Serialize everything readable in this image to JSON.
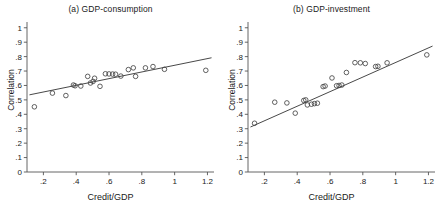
{
  "figure": {
    "background": "#ffffff",
    "axis_color": "#555555",
    "marker_color": "#444444",
    "line_color": "#333333"
  },
  "chart_data": [
    {
      "type": "scatter",
      "title": "(a) GDP-consumption",
      "xlabel": "Credit/GDP",
      "ylabel": "Correlation",
      "xlim": [
        0.1,
        1.24
      ],
      "ylim": [
        0,
        1.04
      ],
      "xticks": [
        0.2,
        0.4,
        0.6,
        0.8,
        1.0,
        1.2
      ],
      "xticklabels": [
        ".2",
        ".4",
        ".6",
        ".8",
        "1",
        "1.2"
      ],
      "yticks": [
        0,
        0.1,
        0.2,
        0.3,
        0.4,
        0.5,
        0.6,
        0.7,
        0.8,
        0.9,
        1.0
      ],
      "yticklabels": [
        "0",
        ".1",
        ".2",
        ".3",
        ".4",
        ".5",
        ".6",
        ".7",
        ".8",
        ".9",
        "1"
      ],
      "grid": false,
      "legend": "none",
      "marker": "open-circle",
      "points": [
        {
          "x": 0.145,
          "y": 0.452
        },
        {
          "x": 0.255,
          "y": 0.547
        },
        {
          "x": 0.337,
          "y": 0.53
        },
        {
          "x": 0.383,
          "y": 0.603
        },
        {
          "x": 0.393,
          "y": 0.598
        },
        {
          "x": 0.428,
          "y": 0.596
        },
        {
          "x": 0.47,
          "y": 0.663
        },
        {
          "x": 0.487,
          "y": 0.617
        },
        {
          "x": 0.503,
          "y": 0.628
        },
        {
          "x": 0.512,
          "y": 0.65
        },
        {
          "x": 0.545,
          "y": 0.594
        },
        {
          "x": 0.578,
          "y": 0.681
        },
        {
          "x": 0.6,
          "y": 0.68
        },
        {
          "x": 0.622,
          "y": 0.679
        },
        {
          "x": 0.64,
          "y": 0.678
        },
        {
          "x": 0.672,
          "y": 0.665
        },
        {
          "x": 0.718,
          "y": 0.71
        },
        {
          "x": 0.748,
          "y": 0.722
        },
        {
          "x": 0.762,
          "y": 0.663
        },
        {
          "x": 0.822,
          "y": 0.722
        },
        {
          "x": 0.868,
          "y": 0.731
        },
        {
          "x": 0.938,
          "y": 0.712
        },
        {
          "x": 1.19,
          "y": 0.705
        }
      ],
      "fit_line": {
        "x": [
          0.115,
          1.225
        ],
        "y": [
          0.535,
          0.792
        ]
      }
    },
    {
      "type": "scatter",
      "title": "(b) GDP-investment",
      "xlabel": "Credit/GDP",
      "ylabel": "Correlation",
      "xlim": [
        0.1,
        1.24
      ],
      "ylim": [
        0,
        1.04
      ],
      "xticks": [
        0.2,
        0.4,
        0.6,
        0.8,
        1.0,
        1.2
      ],
      "xticklabels": [
        ".2",
        ".4",
        ".6",
        ".8",
        "1",
        "1.2"
      ],
      "yticks": [
        0,
        0.1,
        0.2,
        0.3,
        0.4,
        0.5,
        0.6,
        0.7,
        0.8,
        0.9,
        1.0
      ],
      "yticklabels": [
        "0",
        ".1",
        ".2",
        ".3",
        ".4",
        ".5",
        ".6",
        ".7",
        ".8",
        ".9",
        "1"
      ],
      "grid": false,
      "legend": "none",
      "marker": "open-circle",
      "points": [
        {
          "x": 0.14,
          "y": 0.338
        },
        {
          "x": 0.263,
          "y": 0.484
        },
        {
          "x": 0.337,
          "y": 0.479
        },
        {
          "x": 0.388,
          "y": 0.408
        },
        {
          "x": 0.44,
          "y": 0.496
        },
        {
          "x": 0.452,
          "y": 0.5
        },
        {
          "x": 0.462,
          "y": 0.465
        },
        {
          "x": 0.487,
          "y": 0.47
        },
        {
          "x": 0.505,
          "y": 0.474
        },
        {
          "x": 0.523,
          "y": 0.477
        },
        {
          "x": 0.558,
          "y": 0.592
        },
        {
          "x": 0.57,
          "y": 0.596
        },
        {
          "x": 0.612,
          "y": 0.652
        },
        {
          "x": 0.64,
          "y": 0.598
        },
        {
          "x": 0.655,
          "y": 0.6
        },
        {
          "x": 0.672,
          "y": 0.603
        },
        {
          "x": 0.7,
          "y": 0.69
        },
        {
          "x": 0.752,
          "y": 0.758
        },
        {
          "x": 0.785,
          "y": 0.757
        },
        {
          "x": 0.815,
          "y": 0.752
        },
        {
          "x": 0.878,
          "y": 0.731
        },
        {
          "x": 0.892,
          "y": 0.733
        },
        {
          "x": 0.948,
          "y": 0.757
        },
        {
          "x": 1.19,
          "y": 0.812
        }
      ],
      "fit_line": {
        "x": [
          0.115,
          1.225
        ],
        "y": [
          0.312,
          0.873
        ]
      }
    }
  ]
}
